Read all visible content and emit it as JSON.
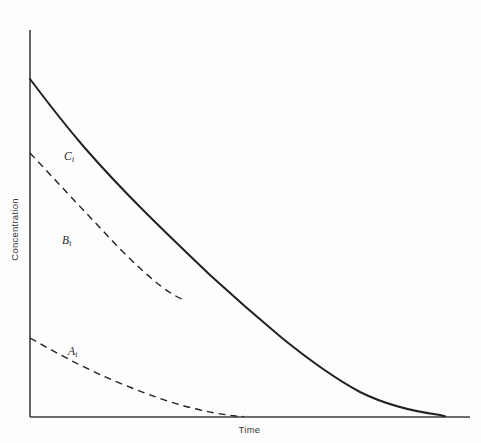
{
  "figure": {
    "background_color": "#fdfdfd",
    "line_color": "#222222",
    "width": 481,
    "height": 443
  },
  "axes": {
    "xlabel": "Time",
    "ylabel": "Concentration",
    "x_origin_px": 30,
    "y_origin_px": 417,
    "x_end_px": 470,
    "y_top_px": 30,
    "ticks": [],
    "tick_labels": [],
    "grid": false
  },
  "annotations": {
    "c_label": {
      "text": "C",
      "subscript": "t"
    },
    "b_label": {
      "text": "B",
      "subscript": "t"
    },
    "a_label": {
      "text": "A",
      "subscript": "t"
    }
  },
  "chart_data": {
    "type": "line",
    "title": "",
    "subtitle": "",
    "xlabel": "Time",
    "ylabel": "Concentration",
    "xlim": [
      0,
      1
    ],
    "ylim": [
      0,
      1
    ],
    "grid": false,
    "legend": "inline-annotations",
    "legend_position": "inline",
    "axis_tick_labels": {
      "x": [],
      "y": []
    },
    "series": [
      {
        "name": "C_t",
        "label": "C",
        "sublabel": "t",
        "style": "solid",
        "color": "#222222",
        "linewidth": 2.0,
        "annotation_xy": [
          0.16,
          0.79
        ],
        "x": [
          0.0,
          0.05,
          0.1,
          0.15,
          0.2,
          0.25,
          0.3,
          0.34,
          0.4,
          0.45,
          0.5,
          0.55,
          0.6,
          0.65,
          0.7,
          0.75,
          0.8,
          0.85,
          0.9,
          0.93
        ],
        "y": [
          0.872,
          0.78,
          0.7,
          0.628,
          0.562,
          0.5,
          0.443,
          0.4,
          0.34,
          0.296,
          0.254,
          0.215,
          0.179,
          0.146,
          0.115,
          0.087,
          0.062,
          0.039,
          0.018,
          0.005
        ]
      },
      {
        "name": "B_t",
        "label": "B",
        "sublabel": "t",
        "style": "dashed",
        "color": "#222222",
        "linewidth": 1.4,
        "dash_pattern": [
          7,
          5
        ],
        "annotation_xy": [
          0.14,
          0.48
        ],
        "x": [
          0.0,
          0.04,
          0.08,
          0.12,
          0.16,
          0.2,
          0.24,
          0.28,
          0.32,
          0.34
        ],
        "y": [
          0.681,
          0.63,
          0.58,
          0.532,
          0.487,
          0.444,
          0.425,
          0.412,
          0.404,
          0.4
        ]
      },
      {
        "name": "A_t",
        "label": "A",
        "sublabel": "t",
        "style": "dashed",
        "color": "#222222",
        "linewidth": 1.4,
        "dash_pattern": [
          7,
          5
        ],
        "annotation_xy": [
          0.18,
          0.175
        ],
        "x": [
          0.0,
          0.05,
          0.1,
          0.15,
          0.2,
          0.25,
          0.3,
          0.35,
          0.4,
          0.45,
          0.47
        ],
        "y": [
          0.204,
          0.176,
          0.15,
          0.124,
          0.1,
          0.077,
          0.056,
          0.037,
          0.02,
          0.006,
          0.002
        ]
      }
    ]
  }
}
